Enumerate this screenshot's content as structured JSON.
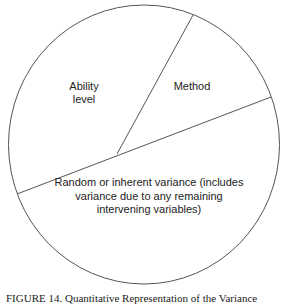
{
  "diagram": {
    "type": "partitioned-circle",
    "segments": [
      {
        "id": "ability",
        "label_lines": [
          "Ability",
          "level"
        ]
      },
      {
        "id": "method",
        "label_lines": [
          "Method"
        ]
      },
      {
        "id": "random",
        "label_lines": [
          "Random or inherent variance (includes",
          "variance due to any remaining",
          "intervening variables)"
        ]
      }
    ],
    "stroke_color": "#555555",
    "background": "#ffffff"
  },
  "caption": "FIGURE 14.  Quantitative Representation of the Variance"
}
